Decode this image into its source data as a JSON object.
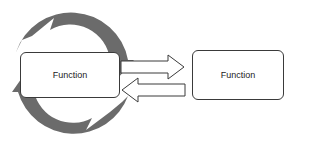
{
  "diagram": {
    "left_box": {
      "label": "Function"
    },
    "right_box": {
      "label": "Function"
    },
    "cycle_arrows": {
      "color": "#6b6b6b",
      "count": 2
    },
    "connectors": [
      {
        "direction": "right",
        "from": "left_box",
        "to": "right_box"
      },
      {
        "direction": "left",
        "from": "right_box",
        "to": "left_box"
      }
    ]
  }
}
